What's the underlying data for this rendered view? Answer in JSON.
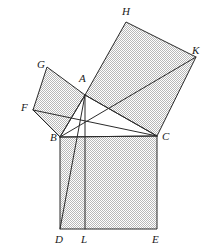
{
  "figure": {
    "canvas": {
      "width": 209,
      "height": 252
    },
    "colors": {
      "stroke": "#2b2b2b",
      "fill": "#e3e3e3",
      "hatch": "#b0b0b0",
      "background": "#ffffff",
      "label": "#1a1a1a"
    },
    "stroke_width": 1
  },
  "points": {
    "A": {
      "x": 85,
      "y": 95,
      "label": "A",
      "label_x": 79,
      "label_y": 80
    },
    "B": {
      "x": 60,
      "y": 137,
      "label": "B",
      "label_x": 50,
      "label_y": 137
    },
    "C": {
      "x": 157,
      "y": 136,
      "label": "C",
      "label_x": 162,
      "label_y": 136
    },
    "D": {
      "x": 60,
      "y": 229,
      "label": "D",
      "label_x": 55,
      "label_y": 243
    },
    "E": {
      "x": 157,
      "y": 229,
      "label": "E",
      "label_x": 152,
      "label_y": 243
    },
    "L": {
      "x": 85,
      "y": 229,
      "label": "L",
      "label_x": 81,
      "label_y": 243
    },
    "F": {
      "x": 33,
      "y": 110,
      "label": "F",
      "label_x": 21,
      "label_y": 108
    },
    "G": {
      "x": 47,
      "y": 67,
      "label": "G",
      "label_x": 37,
      "label_y": 66
    },
    "H": {
      "x": 126,
      "y": 22,
      "label": "H",
      "label_x": 122,
      "label_y": 12
    },
    "K": {
      "x": 196,
      "y": 57,
      "label": "K",
      "label_x": 192,
      "label_y": 51
    }
  },
  "squares": [
    {
      "name": "square-on-hypotenuse-BDEC",
      "vertices": "B,D,E,C",
      "path": "60,137 60,229 157,229 157,136",
      "filled": true
    },
    {
      "name": "square-on-leg-ABFG",
      "vertices": "A,B,F,G",
      "path": "85,95 60,137 33,110 47,67",
      "filled": true
    },
    {
      "name": "square-on-leg-ACKH",
      "vertices": "A,H,K,C",
      "path": "85,95 126,22 196,57 157,136",
      "filled": true
    }
  ],
  "segments": [
    {
      "name": "segment-AB",
      "from": "A",
      "to": "B",
      "x1": 85,
      "y1": 95,
      "x2": 60,
      "y2": 137
    },
    {
      "name": "segment-AC",
      "from": "A",
      "to": "C",
      "x1": 85,
      "y1": 95,
      "x2": 157,
      "y2": 136
    },
    {
      "name": "segment-BC",
      "from": "B",
      "to": "C",
      "x1": 60,
      "y1": 137,
      "x2": 157,
      "y2": 136
    },
    {
      "name": "segment-AD",
      "from": "A",
      "to": "D",
      "x1": 85,
      "y1": 95,
      "x2": 60,
      "y2": 229
    },
    {
      "name": "segment-AL",
      "from": "A",
      "to": "L",
      "x1": 85,
      "y1": 95,
      "x2": 85,
      "y2": 229
    },
    {
      "name": "segment-FC",
      "from": "F",
      "to": "C",
      "x1": 33,
      "y1": 110,
      "x2": 157,
      "y2": 136
    },
    {
      "name": "segment-FB",
      "from": "F",
      "to": "B",
      "x1": 33,
      "y1": 110,
      "x2": 60,
      "y2": 137
    },
    {
      "name": "segment-BK",
      "from": "B",
      "to": "K",
      "x1": 60,
      "y1": 137,
      "x2": 196,
      "y2": 57
    }
  ],
  "labels": {
    "A": "A",
    "B": "B",
    "C": "C",
    "D": "D",
    "E": "E",
    "L": "L",
    "F": "F",
    "G": "G",
    "H": "H",
    "K": "K"
  }
}
